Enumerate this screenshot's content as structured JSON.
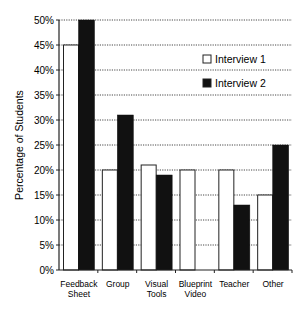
{
  "chart_data": {
    "type": "bar",
    "title": "",
    "xlabel": "",
    "ylabel": "Percentage of Students",
    "ylim": [
      0,
      50
    ],
    "yticks": [
      "0%",
      "5%",
      "10%",
      "15%",
      "20%",
      "25%",
      "30%",
      "35%",
      "40%",
      "45%",
      "50%"
    ],
    "grid": "horizontal dotted",
    "legend_position": "upper right inside",
    "categories": [
      [
        "Feedback",
        "Sheet"
      ],
      [
        "Group"
      ],
      [
        "Visual",
        "Tools"
      ],
      [
        "Blueprint",
        "Video"
      ],
      [
        "Teacher"
      ],
      [
        "Other"
      ]
    ],
    "series": [
      {
        "name": "Interview 1",
        "color": "#ffffff",
        "values": [
          45,
          20,
          21,
          20,
          20,
          15
        ]
      },
      {
        "name": "Interview 2",
        "color": "#111111",
        "values": [
          50,
          31,
          19,
          0,
          13,
          25
        ]
      }
    ]
  }
}
